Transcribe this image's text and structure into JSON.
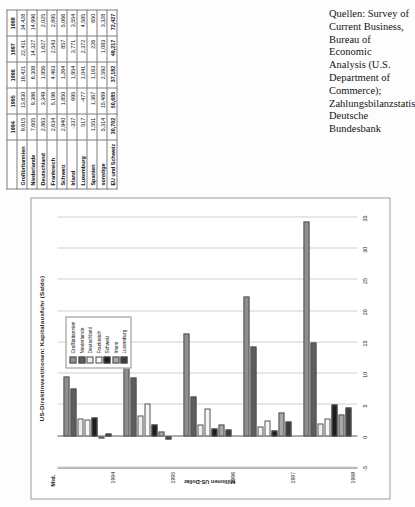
{
  "figure": {
    "chart_title": "US-Direktinvestitionen: Kapitalausfuhr (Saldo)",
    "unit_label": "Mrd.",
    "y_axis_label": "Millionen US-Dollar"
  },
  "source_note": "Quellen: Survey of Current Business, Bureau of Economic Analysis (U.S. Department of Commerce); Zahlungsbilanzstatistik, Deutsche Bundesbank",
  "legend": {
    "items": [
      {
        "label": "Großbritannien",
        "color": "#8f8f8f"
      },
      {
        "label": "Niederlande",
        "color": "#5d5d5d"
      },
      {
        "label": "Deutschland",
        "color": "#ededed"
      },
      {
        "label": "Frankreich",
        "color": "#f7f7f7"
      },
      {
        "label": "Schweiz",
        "color": "#1d1d1d"
      },
      {
        "label": "Irland",
        "color": "#a8a8a8"
      },
      {
        "label": "Luxemburg",
        "color": "#3a3a3a"
      }
    ]
  },
  "chart_data": {
    "type": "bar",
    "title": "US-Direktinvestitionen: Kapitalausfuhr (Saldo)",
    "xlabel": "",
    "ylabel": "Millionen US-Dollar",
    "unit_note": "Mrd.",
    "grid": true,
    "legend_position": "top-right",
    "categories": [
      "1994",
      "1995",
      "1996",
      "1997",
      "1998"
    ],
    "ylim": [
      -5,
      35
    ],
    "yticks": [
      35,
      30,
      25,
      20,
      15,
      10,
      5,
      0,
      -5
    ],
    "series": [
      {
        "name": "Großbritannien",
        "color": "#8f8f8f",
        "values": [
          9615,
          13830,
          16421,
          22411,
          34428
        ]
      },
      {
        "name": "Niederlande",
        "color": "#5d5d5d",
        "values": [
          7605,
          9386,
          6308,
          14327,
          14996
        ]
      },
      {
        "name": "Deutschland",
        "color": "#ededed",
        "values": [
          2863,
          3349,
          1956,
          1627,
          2025
        ]
      },
      {
        "name": "Frankreich",
        "color": "#f7f7f7",
        "values": [
          2634,
          5196,
          4463,
          2543,
          2895
        ]
      },
      {
        "name": "Schweiz",
        "color": "#1d1d1d",
        "values": [
          2940,
          1850,
          1264,
          857,
          5066
        ]
      },
      {
        "name": "Irland",
        "color": "#a8a8a8",
        "values": [
          -337,
          695,
          1954,
          3771,
          3554
        ]
      },
      {
        "name": "Luxemburg",
        "color": "#3a3a3a",
        "values": [
          517,
          -477,
          1041,
          2372,
          4585
        ]
      }
    ]
  },
  "table": {
    "corner": "",
    "columns": [
      "1994",
      "1995",
      "1996",
      "1997",
      "1998"
    ],
    "rows": [
      {
        "label": "Großbritannien",
        "values": [
          "9,615",
          "13,830",
          "16,421",
          "22,411",
          "34,428"
        ],
        "total": false
      },
      {
        "label": "Niederlande",
        "values": [
          "7,605",
          "9,386",
          "6,308",
          "14,327",
          "14,996"
        ],
        "total": false
      },
      {
        "label": "Deutschland",
        "values": [
          "2,863",
          "3,349",
          "1,956",
          "1,627",
          "2,025"
        ],
        "total": false
      },
      {
        "label": "Frankreich",
        "values": [
          "2,634",
          "5,196",
          "4,463",
          "2,543",
          "2,895"
        ],
        "total": false
      },
      {
        "label": "Schweiz",
        "values": [
          "2,940",
          "1,850",
          "1,264",
          "857",
          "5,066"
        ],
        "total": false
      },
      {
        "label": "Irland",
        "values": [
          "-337",
          "695",
          "1,954",
          "3,771",
          "3,554"
        ],
        "total": false
      },
      {
        "label": "Luxemburg",
        "values": [
          "517",
          "-477",
          "1,041",
          "2,372",
          "4,585"
        ],
        "total": false
      },
      {
        "label": "Spanien",
        "values": [
          "1,551",
          "1,367",
          "1,163",
          "226",
          "650"
        ],
        "total": false
      },
      {
        "label": "sonstige",
        "values": [
          "5,314",
          "15,489",
          "2,592",
          "1,083",
          "3,328"
        ],
        "total": false
      },
      {
        "label": "EU und Schweiz",
        "values": [
          "30,702",
          "50,685",
          "37,182",
          "49,217",
          "72,427"
        ],
        "total": true
      }
    ]
  }
}
